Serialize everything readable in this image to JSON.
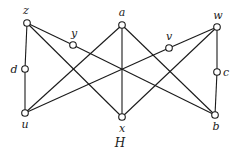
{
  "diagram": {
    "title": "H",
    "nodes": [
      {
        "id": "z",
        "label": "z",
        "x": 27,
        "y": 23,
        "lx": 26,
        "ly": 14
      },
      {
        "id": "y",
        "label": "y",
        "x": 73,
        "y": 45,
        "lx": 74,
        "ly": 37
      },
      {
        "id": "a",
        "label": "a",
        "x": 122,
        "y": 25,
        "lx": 122,
        "ly": 16
      },
      {
        "id": "v",
        "label": "v",
        "x": 169,
        "y": 48,
        "lx": 169,
        "ly": 40
      },
      {
        "id": "w",
        "label": "w",
        "x": 217,
        "y": 27,
        "lx": 218,
        "ly": 19
      },
      {
        "id": "d",
        "label": "d",
        "x": 25,
        "y": 69,
        "lx": 14,
        "ly": 73
      },
      {
        "id": "c",
        "label": "c",
        "x": 217,
        "y": 72,
        "lx": 226,
        "ly": 76
      },
      {
        "id": "u",
        "label": "u",
        "x": 25,
        "y": 113,
        "lx": 25,
        "ly": 128
      },
      {
        "id": "x",
        "label": "x",
        "x": 122,
        "y": 117,
        "lx": 122,
        "ly": 132
      },
      {
        "id": "b",
        "label": "b",
        "x": 215,
        "y": 115,
        "lx": 216,
        "ly": 130
      }
    ],
    "edges": [
      [
        "z",
        "d"
      ],
      [
        "d",
        "u"
      ],
      [
        "z",
        "y"
      ],
      [
        "y",
        "b"
      ],
      [
        "z",
        "x"
      ],
      [
        "a",
        "u"
      ],
      [
        "a",
        "x"
      ],
      [
        "a",
        "b"
      ],
      [
        "w",
        "v"
      ],
      [
        "v",
        "u"
      ],
      [
        "w",
        "x"
      ],
      [
        "w",
        "c"
      ],
      [
        "c",
        "b"
      ]
    ]
  }
}
